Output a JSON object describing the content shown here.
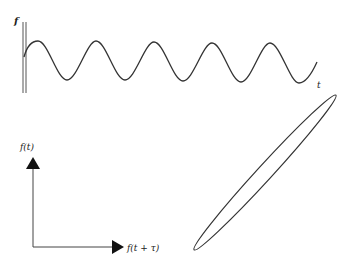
{
  "figure": {
    "time_series": {
      "y_label": "f",
      "x_label": "t",
      "curve": "sinusoid",
      "cycles_visible": 5
    },
    "phase_plot": {
      "y_axis_label": "f(t)",
      "x_axis_label": "f(t + τ)",
      "shape": "elongated ellipse tilted ~47° (positive correlation)"
    },
    "colors": {
      "stroke": "#333333",
      "background": "#ffffff"
    }
  }
}
